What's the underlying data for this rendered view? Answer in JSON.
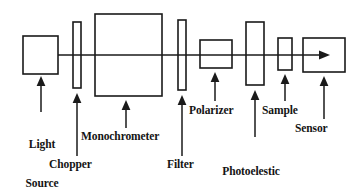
{
  "diagram": {
    "type": "optical-bench-block-diagram",
    "colors": {
      "stroke": "#1a1a1a",
      "fill": "#ffffff",
      "background": "#ffffff",
      "text": "#141414"
    },
    "beam": {
      "name": "optical-beam",
      "direction": "left-to-right",
      "start_x": 58,
      "end_x": 330,
      "y": 55,
      "arrowhead": "right"
    },
    "components": [
      {
        "id": "light-source",
        "label": "Light\nSource",
        "label_line1": "Light",
        "label_line2": "Source",
        "shape": "rect",
        "x": 23,
        "y": 36,
        "width": 35,
        "height": 38,
        "label_x": 20,
        "label_y": 118,
        "leader_from_y": 112,
        "leader_to_y": 78,
        "leader_x": 41
      },
      {
        "id": "chopper",
        "label": "Chopper",
        "shape": "slab",
        "x": 73,
        "y": 22,
        "width": 8,
        "height": 66,
        "label_x": 50,
        "label_y": 161,
        "leader_from_y": 156,
        "leader_to_y": 93,
        "leader_x": 77
      },
      {
        "id": "monochrometer",
        "label": "Monochrometer",
        "shape": "rect",
        "x": 95,
        "y": 14,
        "width": 67,
        "height": 82,
        "label_x": 82,
        "label_y": 133,
        "leader_from_y": 128,
        "leader_to_y": 100,
        "leader_x": 126
      },
      {
        "id": "filter",
        "label": "Filter",
        "shape": "slab",
        "x": 178,
        "y": 20,
        "width": 8,
        "height": 70,
        "label_x": 168,
        "label_y": 161,
        "leader_from_y": 156,
        "leader_to_y": 95,
        "leader_x": 182
      },
      {
        "id": "polarizer",
        "label": "Polarizer",
        "shape": "rect",
        "x": 200,
        "y": 40,
        "width": 32,
        "height": 28,
        "label_x": 190,
        "label_y": 106,
        "leader_from_y": 101,
        "leader_to_y": 72,
        "leader_x": 215
      },
      {
        "id": "photoelestic-modulator",
        "label": "Photoelestic\nModulator",
        "label_line1": "Photoelestic",
        "label_line2": "Modulator",
        "shape": "slab",
        "x": 246,
        "y": 22,
        "width": 18,
        "height": 63,
        "label_x": 212,
        "label_y": 142,
        "leader_from_y": 137,
        "leader_to_y": 90,
        "leader_x": 255
      },
      {
        "id": "sample",
        "label": "Sample",
        "shape": "rect",
        "x": 278,
        "y": 38,
        "width": 14,
        "height": 32,
        "label_x": 263,
        "label_y": 106,
        "leader_from_y": 101,
        "leader_to_y": 74,
        "leader_x": 285
      },
      {
        "id": "sensor",
        "label": "Sensor",
        "shape": "rect",
        "x": 303,
        "y": 38,
        "width": 42,
        "height": 34,
        "label_x": 296,
        "label_y": 124,
        "leader_from_y": 119,
        "leader_to_y": 76,
        "leader_x": 324
      }
    ]
  }
}
